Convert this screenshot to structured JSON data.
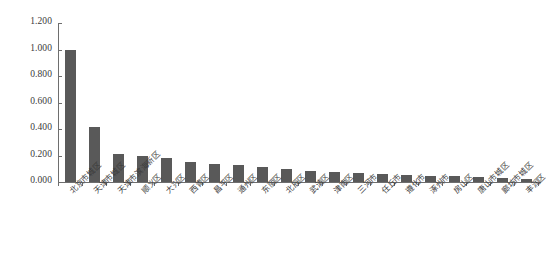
{
  "chart_data": {
    "type": "bar",
    "title": "",
    "subtitle": "",
    "xlabel": "",
    "ylabel": "",
    "ylim": [
      0,
      1.2
    ],
    "ytick_labels": [
      "1.200",
      "1.000",
      "0.800",
      "0.600",
      "0.400",
      "0.200",
      "0.000"
    ],
    "ytick_values": [
      1.2,
      1.0,
      0.8,
      0.6,
      0.4,
      0.2,
      0.0
    ],
    "grid": false,
    "legend": false,
    "legend_position": "none",
    "series_color": "#595959",
    "axis_color": "#6e6e6e",
    "categories": [
      "北京市城区",
      "天津市城区",
      "天津市滨海新区",
      "顺义区",
      "大兴区",
      "西青区",
      "昌平区",
      "通州区",
      "东丽区",
      "北辰区",
      "武清区",
      "津南区",
      "三河市",
      "任丘市",
      "遵化市",
      "涿州市",
      "房山区",
      "唐山市城区",
      "廊坊市城区",
      "丰润区"
    ],
    "values": [
      1.0,
      0.415,
      0.215,
      0.195,
      0.185,
      0.15,
      0.135,
      0.125,
      0.11,
      0.1,
      0.085,
      0.075,
      0.07,
      0.062,
      0.055,
      0.048,
      0.042,
      0.038,
      0.032,
      0.025
    ]
  }
}
